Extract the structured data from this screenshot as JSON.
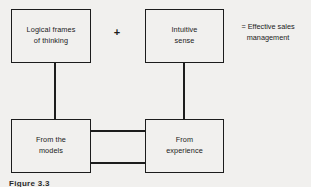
{
  "diagram": {
    "background_color": "#f1f0ee",
    "line_color": "#1c1c1c",
    "text_color": "#1a1a1a",
    "boxes": [
      {
        "id": "logical-frames",
        "line1": "Logical frames",
        "line2": "of thinking"
      },
      {
        "id": "intuitive-sense",
        "line1": "Intuitive",
        "line2": "sense"
      },
      {
        "id": "from-the-models",
        "line1": "From the",
        "line2": "models"
      },
      {
        "id": "from-experience",
        "line1": "From",
        "line2": "experience"
      }
    ],
    "operators": {
      "plus": "+",
      "equals_line1": "= Effective sales",
      "equals_line2": "management"
    },
    "caption": "Figure 3.3"
  }
}
